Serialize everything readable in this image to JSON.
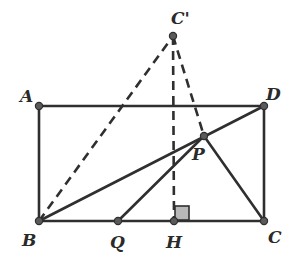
{
  "diagram": {
    "type": "geometry",
    "colors": {
      "stroke": "#2f2f2f",
      "point_fill": "#5a5a5a",
      "right_angle_fill": "#b8b8b8"
    },
    "points": [
      {
        "id": "A",
        "label": "A",
        "x": 39,
        "y": 106
      },
      {
        "id": "D",
        "label": "D",
        "x": 264,
        "y": 106
      },
      {
        "id": "B",
        "label": "B",
        "x": 39,
        "y": 221
      },
      {
        "id": "C",
        "label": "C",
        "x": 264,
        "y": 221
      },
      {
        "id": "C_prime",
        "label": "C'",
        "x": 173,
        "y": 36
      },
      {
        "id": "P",
        "label": "P",
        "x": 204,
        "y": 136
      },
      {
        "id": "Q",
        "label": "Q",
        "x": 118,
        "y": 221
      },
      {
        "id": "H",
        "label": "H",
        "x": 174,
        "y": 221
      }
    ],
    "solid_segments": [
      "AD",
      "AB",
      "DC",
      "BC",
      "BD",
      "QP",
      "PC"
    ],
    "dashed_segments": [
      "BC'",
      "C'H",
      "C'P"
    ],
    "right_angle_at": "H"
  }
}
